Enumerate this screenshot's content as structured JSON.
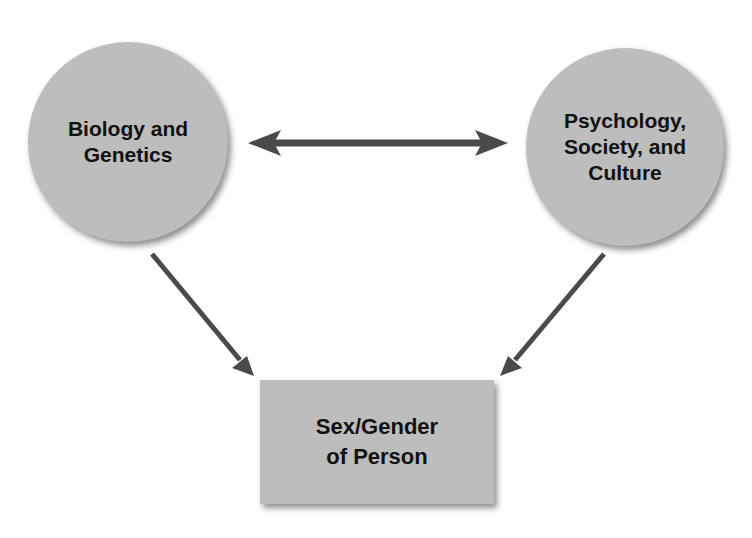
{
  "diagram": {
    "nodes": {
      "biology": {
        "lines": [
          "Biology and",
          "Genetics"
        ],
        "shape": "circle"
      },
      "psychology": {
        "lines": [
          "Psychology,",
          "Society, and",
          "Culture"
        ],
        "shape": "circle"
      },
      "outcome": {
        "lines": [
          "Sex/Gender",
          "of Person"
        ],
        "shape": "rectangle"
      }
    },
    "edges": [
      {
        "from": "biology",
        "to": "psychology",
        "type": "bidirectional"
      },
      {
        "from": "biology",
        "to": "outcome",
        "type": "directed"
      },
      {
        "from": "psychology",
        "to": "outcome",
        "type": "directed"
      }
    ],
    "colors": {
      "node_fill": "#bdbdbd",
      "arrow": "#4a4a4a",
      "text": "#111111",
      "background": "#ffffff"
    }
  }
}
